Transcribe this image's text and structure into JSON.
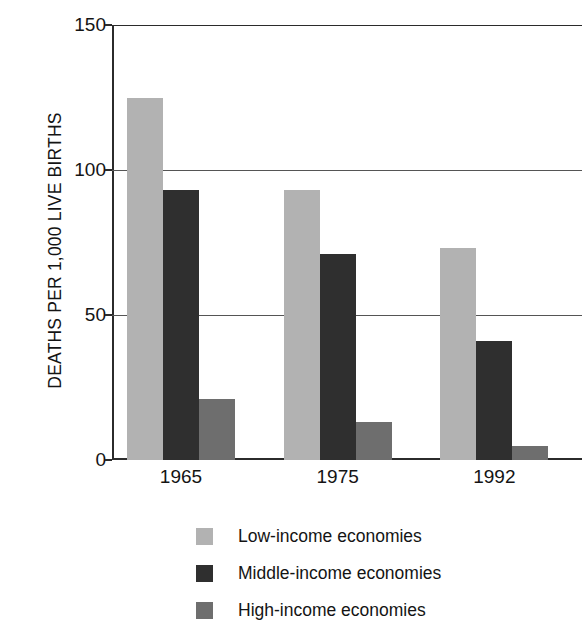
{
  "chart_data": {
    "type": "bar",
    "title": "",
    "subtitle": "",
    "xlabel": "",
    "ylabel": "DEATHS PER 1,000 LIVE BIRTHS",
    "categories": [
      "1965",
      "1975",
      "1992"
    ],
    "series": [
      {
        "name": "Low-income economies",
        "values": [
          125,
          93,
          73
        ],
        "color": "#b2b2b2"
      },
      {
        "name": "Middle-income economies",
        "values": [
          93,
          71,
          41
        ],
        "color": "#2f2f2f"
      },
      {
        "name": "High-income economies",
        "values": [
          21,
          13,
          5
        ],
        "color": "#6e6e6e"
      }
    ],
    "ylim": [
      0,
      150
    ],
    "yticks": [
      0,
      50,
      100,
      150
    ],
    "ytick_labels": [
      "0",
      "50",
      "100",
      "150"
    ],
    "grid": true,
    "grid_axis": "y",
    "legend_position": "bottom",
    "bar_group_gap": true,
    "background": "#ffffff",
    "axis_color": "#2b2b2b"
  },
  "axis": {
    "y_title": "DEATHS PER 1,000 LIVE BIRTHS",
    "y_tick_0": "0",
    "y_tick_50": "50",
    "y_tick_100": "100",
    "y_tick_150": "150"
  },
  "x_axis": {
    "label_1": "1965",
    "label_2": "1975",
    "label_3": "1992"
  },
  "legend": {
    "items": [
      {
        "label": "Low-income economies",
        "color": "#b2b2b2",
        "icon": "legend-swatch-low"
      },
      {
        "label": "Middle-income economies",
        "color": "#2f2f2f",
        "icon": "legend-swatch-middle"
      },
      {
        "label": "High-income economies",
        "color": "#6e6e6e",
        "icon": "legend-swatch-high"
      }
    ]
  }
}
